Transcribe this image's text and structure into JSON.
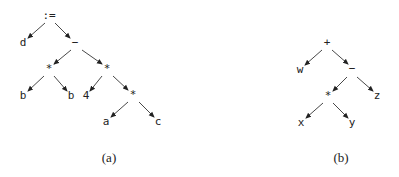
{
  "figure": {
    "trees": [
      {
        "id": "a",
        "caption": "(a)",
        "caption_pos": [
          109,
          162
        ],
        "nodes": [
          {
            "id": "assign",
            "label": ":=",
            "x": 49,
            "y": 19
          },
          {
            "id": "d",
            "label": "d",
            "x": 23,
            "y": 46
          },
          {
            "id": "minus",
            "label": "−",
            "x": 75,
            "y": 46
          },
          {
            "id": "mul1",
            "label": "*",
            "x": 49,
            "y": 72
          },
          {
            "id": "mul2",
            "label": "*",
            "x": 107,
            "y": 72
          },
          {
            "id": "b1",
            "label": "b",
            "x": 23,
            "y": 99
          },
          {
            "id": "b2",
            "label": "b",
            "x": 71,
            "y": 99
          },
          {
            "id": "four",
            "label": "4",
            "x": 86,
            "y": 99
          },
          {
            "id": "mul3",
            "label": "*",
            "x": 133,
            "y": 98
          },
          {
            "id": "a",
            "label": "a",
            "x": 106,
            "y": 125
          },
          {
            "id": "c",
            "label": "c",
            "x": 158,
            "y": 125
          }
        ],
        "edges": [
          {
            "from": [
              45,
              23
            ],
            "to": [
              28,
              38
            ]
          },
          {
            "from": [
              55,
              23
            ],
            "to": [
              70,
              38
            ]
          },
          {
            "from": [
              71,
              50
            ],
            "to": [
              54,
              64
            ]
          },
          {
            "from": [
              82,
              50
            ],
            "to": [
              102,
              64
            ]
          },
          {
            "from": [
              44,
              76
            ],
            "to": [
              28,
              91
            ]
          },
          {
            "from": [
              54,
              76
            ],
            "to": [
              67,
              91
            ]
          },
          {
            "from": [
              102,
              76
            ],
            "to": [
              90,
              91
            ]
          },
          {
            "from": [
              113,
              76
            ],
            "to": [
              128,
              90
            ]
          },
          {
            "from": [
              128,
              102
            ],
            "to": [
              111,
              117
            ]
          },
          {
            "from": [
              139,
              102
            ],
            "to": [
              154,
              117
            ]
          }
        ]
      },
      {
        "id": "b",
        "caption": "(b)",
        "caption_pos": [
          341,
          162
        ],
        "nodes": [
          {
            "id": "plus",
            "label": "+",
            "x": 327,
            "y": 46
          },
          {
            "id": "w",
            "label": "w",
            "x": 300,
            "y": 73
          },
          {
            "id": "minus",
            "label": "−",
            "x": 352,
            "y": 72
          },
          {
            "id": "mul",
            "label": "*",
            "x": 328,
            "y": 99
          },
          {
            "id": "z",
            "label": "z",
            "x": 377,
            "y": 99
          },
          {
            "id": "x",
            "label": "x",
            "x": 301,
            "y": 126
          },
          {
            "id": "y",
            "label": "y",
            "x": 352,
            "y": 126
          }
        ],
        "edges": [
          {
            "from": [
              322,
              50
            ],
            "to": [
              305,
              65
            ]
          },
          {
            "from": [
              332,
              50
            ],
            "to": [
              348,
              64
            ]
          },
          {
            "from": [
              347,
              77
            ],
            "to": [
              333,
              91
            ]
          },
          {
            "from": [
              357,
              77
            ],
            "to": [
              373,
              91
            ]
          },
          {
            "from": [
              323,
              103
            ],
            "to": [
              306,
              118
            ]
          },
          {
            "from": [
              333,
              103
            ],
            "to": [
              348,
              118
            ]
          }
        ]
      }
    ]
  }
}
